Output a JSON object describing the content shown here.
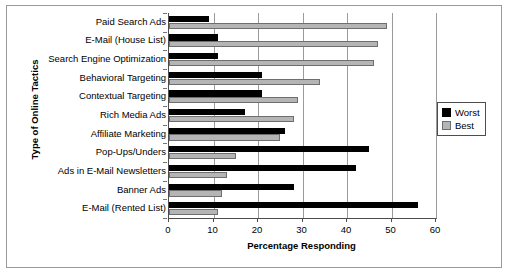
{
  "chart_data": {
    "type": "bar",
    "orientation": "horizontal",
    "title": "",
    "xlabel": "Percentage Responding",
    "ylabel": "Type of Online Tactics",
    "xlim": [
      0,
      60
    ],
    "xticks": [
      0,
      10,
      20,
      30,
      40,
      50,
      60
    ],
    "grid": true,
    "grid_axis": "x",
    "legend_position": "right",
    "categories": [
      "Paid Search Ads",
      "E-Mail (House List)",
      "Search Engine Optimization",
      "Behavioral Targeting",
      "Contextual Targeting",
      "Rich Media Ads",
      "Affiliate Marketing",
      "Pop-Ups/Unders",
      "Ads in E-Mail Newsletters",
      "Banner Ads",
      "E-Mail (Rented List)"
    ],
    "series": [
      {
        "name": "Worst",
        "color": "#000000",
        "values": [
          9,
          11,
          11,
          21,
          21,
          17,
          26,
          45,
          42,
          28,
          56
        ]
      },
      {
        "name": "Best",
        "color": "#b5b5b5",
        "values": [
          49,
          47,
          46,
          34,
          29,
          28,
          25,
          15,
          13,
          12,
          11
        ]
      }
    ]
  },
  "axes": {
    "x_title": "Percentage Responding",
    "y_title": "Type of Online Tactics",
    "x_tick_labels": [
      "0",
      "10",
      "20",
      "30",
      "40",
      "50",
      "60"
    ]
  },
  "legend": {
    "items": [
      {
        "label": "Worst",
        "swatch": "worst"
      },
      {
        "label": "Best",
        "swatch": "best"
      }
    ]
  }
}
